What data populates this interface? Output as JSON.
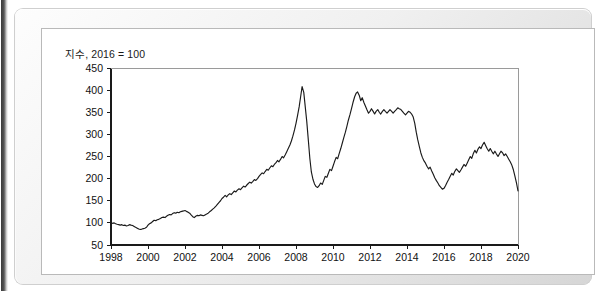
{
  "figure": {
    "title": "지수, 2016 = 100"
  },
  "chart_data": {
    "type": "line",
    "title": "지수, 2016 = 100",
    "xlabel": "",
    "ylabel": "",
    "xlim": [
      1998,
      2020
    ],
    "ylim": [
      50,
      450
    ],
    "ytick_labels": [
      "50",
      "100",
      "150",
      "200",
      "250",
      "300",
      "350",
      "400",
      "450"
    ],
    "yticks": [
      50,
      100,
      150,
      200,
      250,
      300,
      350,
      400,
      450
    ],
    "xtick_labels": [
      "1998",
      "2000",
      "2002",
      "2004",
      "2006",
      "2008",
      "2010",
      "2012",
      "2014",
      "2016",
      "2018",
      "2020"
    ],
    "xticks": [
      1998,
      2000,
      2002,
      2004,
      2006,
      2008,
      2010,
      2012,
      2014,
      2016,
      2018,
      2020
    ],
    "grid": false,
    "legend": false,
    "line_color": "#1a1a1a",
    "series": [
      {
        "name": "index",
        "x": [
          1998.0,
          1998.08,
          1998.17,
          1998.25,
          1998.33,
          1998.42,
          1998.5,
          1998.58,
          1998.67,
          1998.75,
          1998.83,
          1998.92,
          1999.0,
          1999.08,
          1999.17,
          1999.25,
          1999.33,
          1999.42,
          1999.5,
          1999.58,
          1999.67,
          1999.75,
          1999.83,
          1999.92,
          2000.0,
          2000.08,
          2000.17,
          2000.25,
          2000.33,
          2000.42,
          2000.5,
          2000.58,
          2000.67,
          2000.75,
          2000.83,
          2000.92,
          2001.0,
          2001.08,
          2001.17,
          2001.25,
          2001.33,
          2001.42,
          2001.5,
          2001.58,
          2001.67,
          2001.75,
          2001.83,
          2001.92,
          2002.0,
          2002.08,
          2002.17,
          2002.25,
          2002.33,
          2002.42,
          2002.5,
          2002.58,
          2002.67,
          2002.75,
          2002.83,
          2002.92,
          2003.0,
          2003.08,
          2003.17,
          2003.25,
          2003.33,
          2003.42,
          2003.5,
          2003.58,
          2003.67,
          2003.75,
          2003.83,
          2003.92,
          2004.0,
          2004.08,
          2004.17,
          2004.25,
          2004.33,
          2004.42,
          2004.5,
          2004.58,
          2004.67,
          2004.75,
          2004.83,
          2004.92,
          2005.0,
          2005.08,
          2005.17,
          2005.25,
          2005.33,
          2005.42,
          2005.5,
          2005.58,
          2005.67,
          2005.75,
          2005.83,
          2005.92,
          2006.0,
          2006.08,
          2006.17,
          2006.25,
          2006.33,
          2006.42,
          2006.5,
          2006.58,
          2006.67,
          2006.75,
          2006.83,
          2006.92,
          2007.0,
          2007.08,
          2007.17,
          2007.25,
          2007.33,
          2007.42,
          2007.5,
          2007.58,
          2007.67,
          2007.75,
          2007.83,
          2007.92,
          2008.0,
          2008.08,
          2008.17,
          2008.25,
          2008.33,
          2008.42,
          2008.58,
          2008.67,
          2008.75,
          2008.83,
          2008.92,
          2009.0,
          2009.08,
          2009.17,
          2009.25,
          2009.33,
          2009.42,
          2009.5,
          2009.58,
          2009.67,
          2009.75,
          2009.83,
          2009.92,
          2010.0,
          2010.08,
          2010.17,
          2010.25,
          2010.33,
          2010.42,
          2010.5,
          2010.58,
          2010.67,
          2010.75,
          2010.83,
          2010.92,
          2011.0,
          2011.08,
          2011.17,
          2011.25,
          2011.33,
          2011.42,
          2011.5,
          2011.58,
          2011.67,
          2011.75,
          2011.83,
          2011.92,
          2012.0,
          2012.08,
          2012.17,
          2012.25,
          2012.33,
          2012.42,
          2012.5,
          2012.58,
          2012.67,
          2012.75,
          2012.83,
          2012.92,
          2013.0,
          2013.08,
          2013.17,
          2013.25,
          2013.33,
          2013.42,
          2013.5,
          2013.58,
          2013.67,
          2013.75,
          2013.83,
          2013.92,
          2014.0,
          2014.08,
          2014.17,
          2014.25,
          2014.33,
          2014.42,
          2014.5,
          2014.58,
          2014.67,
          2014.75,
          2014.83,
          2014.92,
          2015.0,
          2015.08,
          2015.17,
          2015.25,
          2015.33,
          2015.42,
          2015.5,
          2015.58,
          2015.67,
          2015.75,
          2015.83,
          2015.92,
          2016.0,
          2016.08,
          2016.17,
          2016.25,
          2016.33,
          2016.42,
          2016.5,
          2016.58,
          2016.67,
          2016.75,
          2016.83,
          2016.92,
          2017.0,
          2017.08,
          2017.17,
          2017.25,
          2017.33,
          2017.42,
          2017.5,
          2017.58,
          2017.67,
          2017.75,
          2017.83,
          2017.92,
          2018.0,
          2018.08,
          2018.17,
          2018.25,
          2018.33,
          2018.42,
          2018.5,
          2018.58,
          2018.67,
          2018.75,
          2018.83,
          2018.92,
          2019.0,
          2019.08,
          2019.17,
          2019.25,
          2019.33,
          2019.42,
          2019.5,
          2019.58,
          2019.67,
          2019.75,
          2019.83,
          2019.92,
          2020.0
        ],
        "values": [
          100,
          99,
          100,
          98,
          97,
          96,
          95,
          96,
          94,
          95,
          93,
          94,
          96,
          95,
          94,
          92,
          90,
          88,
          86,
          85,
          86,
          87,
          88,
          90,
          95,
          98,
          100,
          103,
          106,
          105,
          107,
          108,
          110,
          112,
          113,
          112,
          115,
          117,
          119,
          118,
          121,
          123,
          122,
          124,
          123,
          125,
          126,
          127,
          128,
          126,
          124,
          122,
          118,
          114,
          112,
          115,
          117,
          116,
          118,
          117,
          116,
          118,
          120,
          122,
          125,
          128,
          131,
          134,
          138,
          142,
          146,
          150,
          155,
          158,
          162,
          159,
          163,
          166,
          164,
          168,
          172,
          170,
          174,
          177,
          175,
          179,
          183,
          181,
          185,
          189,
          192,
          190,
          194,
          198,
          196,
          200,
          205,
          209,
          213,
          211,
          216,
          221,
          219,
          224,
          229,
          227,
          232,
          236,
          241,
          238,
          244,
          250,
          247,
          254,
          261,
          268,
          276,
          285,
          296,
          310,
          325,
          342,
          362,
          385,
          408,
          395,
          330,
          285,
          245,
          215,
          198,
          188,
          182,
          180,
          184,
          190,
          187,
          196,
          205,
          203,
          212,
          221,
          218,
          228,
          238,
          248,
          245,
          256,
          268,
          280,
          292,
          305,
          318,
          332,
          345,
          358,
          372,
          385,
          393,
          396,
          388,
          376,
          383,
          372,
          364,
          356,
          348,
          352,
          358,
          352,
          346,
          352,
          356,
          350,
          346,
          352,
          356,
          352,
          348,
          352,
          356,
          352,
          348,
          352,
          356,
          360,
          358,
          356,
          352,
          348,
          344,
          348,
          352,
          350,
          346,
          340,
          325,
          305,
          288,
          272,
          258,
          248,
          240,
          235,
          228,
          222,
          226,
          218,
          210,
          202,
          196,
          190,
          184,
          180,
          176,
          178,
          184,
          192,
          198,
          205,
          212,
          208,
          216,
          222,
          218,
          214,
          220,
          226,
          232,
          228,
          235,
          242,
          250,
          246,
          256,
          264,
          258,
          266,
          272,
          268,
          276,
          282,
          275,
          268,
          262,
          268,
          262,
          256,
          262,
          256,
          250,
          256,
          262,
          258,
          252,
          256,
          250,
          244,
          238,
          230,
          220,
          206,
          190,
          172
        ]
      }
    ]
  }
}
